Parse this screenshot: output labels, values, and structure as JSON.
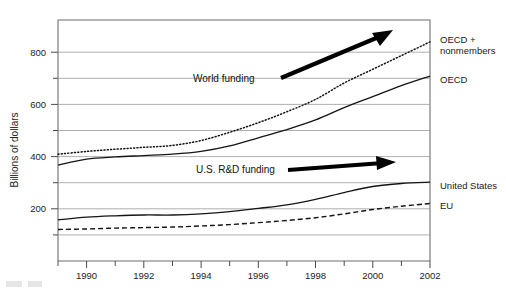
{
  "chart_data": {
    "type": "line",
    "title": "",
    "subtitle": "",
    "xlabel": "",
    "ylabel": "Billions of dollars",
    "xlim": [
      1989,
      2002
    ],
    "ylim": [
      0,
      880
    ],
    "yticks_major": [
      200,
      400,
      600,
      800
    ],
    "yticks_minor": [
      100,
      300,
      500,
      700
    ],
    "xticks_major": [
      1990,
      1992,
      1994,
      1996,
      1998,
      2000,
      2002
    ],
    "xticks_minor": [
      1989,
      1991,
      1993,
      1995,
      1997,
      1999,
      2001
    ],
    "grid": "horizontal",
    "legend_position": "right-of-axes-inline",
    "x": [
      1989,
      1990,
      1991,
      1992,
      1993,
      1994,
      1995,
      1996,
      1997,
      1998,
      1999,
      2000,
      2001,
      2002
    ],
    "series": [
      {
        "name": "OECD + nonmembers",
        "style": "dotted",
        "values": [
          390,
          400,
          408,
          415,
          422,
          440,
          470,
          505,
          545,
          590,
          650,
          700,
          750,
          800
        ]
      },
      {
        "name": "OECD",
        "style": "solid",
        "values": [
          350,
          372,
          380,
          385,
          390,
          400,
          420,
          450,
          480,
          515,
          560,
          600,
          640,
          675
        ]
      },
      {
        "name": "United States",
        "style": "solid",
        "values": [
          150,
          160,
          165,
          168,
          168,
          172,
          180,
          192,
          205,
          225,
          250,
          272,
          283,
          288
        ]
      },
      {
        "name": "EU",
        "style": "dashed",
        "values": [
          115,
          117,
          120,
          122,
          124,
          128,
          133,
          140,
          148,
          158,
          172,
          188,
          200,
          210
        ]
      }
    ],
    "annotations": [
      {
        "name": "world-funding-annotation",
        "text": "World funding",
        "arrow": "up-right"
      },
      {
        "name": "us-rd-funding-annotation",
        "text": "U.S. R&D funding",
        "arrow": "right"
      }
    ],
    "series_labels": [
      {
        "name": "OECD + nonmembers",
        "line1": "OECD +",
        "line2": "nonmembers"
      },
      {
        "name": "OECD",
        "line1": "OECD",
        "line2": ""
      },
      {
        "name": "United States",
        "line1": "United States",
        "line2": ""
      },
      {
        "name": "EU",
        "line1": "EU",
        "line2": ""
      }
    ],
    "ytick_labels": [
      "200",
      "400",
      "600",
      "800"
    ],
    "xtick_labels": [
      "1990",
      "1992",
      "1994",
      "1996",
      "1998",
      "2000",
      "2002"
    ]
  }
}
